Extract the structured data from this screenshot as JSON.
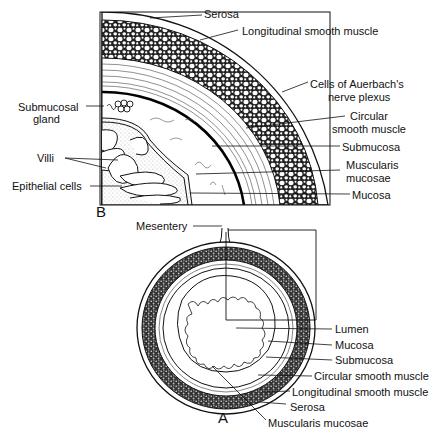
{
  "figure": {
    "panel_b": {
      "letter": "B",
      "title": "Quadrant section of intestinal wall (enlarged)",
      "labels": {
        "serosa": "Serosa",
        "longitudinal_smooth_muscle": "Longitudinal smooth muscle",
        "auerbach_line1": "Cells of Auerbach's",
        "auerbach_line2": "nerve plexus",
        "circular_line1": "Circular",
        "circular_line2": "smooth muscle",
        "submucosa": "Submucosa",
        "muscularis_line1": "Muscularis",
        "muscularis_line2": "mucosae",
        "mucosa": "Mucosa",
        "submucosal_gland_line1": "Submucosal",
        "submucosal_gland_line2": "gland",
        "villi": "Villi",
        "epithelial_cells": "Epithelial cells"
      }
    },
    "panel_a": {
      "letter": "A",
      "labels": {
        "mesentery": "Mesentery",
        "lumen": "Lumen",
        "mucosa": "Mucosa",
        "submucosa": "Submucosa",
        "circular_smooth_muscle": "Circular smooth muscle",
        "longitudinal_smooth_muscle": "Longitudinal smooth muscle",
        "serosa": "Serosa",
        "muscularis_mucosae": "Muscularis mucosae"
      }
    }
  }
}
